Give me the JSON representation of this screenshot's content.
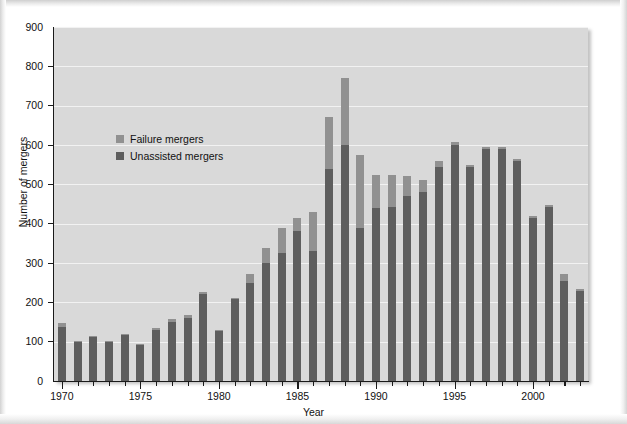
{
  "figure": {
    "background_color": "#ffffff",
    "plot_background_color": "#d9d9d9",
    "gridline_color": "#f2f2f2"
  },
  "legend": {
    "position": "inside-top-left",
    "items": [
      {
        "label": "Failure mergers",
        "color": "#919191",
        "swatch_name": "legend-swatch-failure"
      },
      {
        "label": "Unassisted mergers",
        "color": "#5e5e5e",
        "swatch_name": "legend-swatch-unassisted"
      }
    ]
  },
  "chart_data": {
    "type": "bar",
    "stacked": true,
    "title": "",
    "xlabel": "Year",
    "ylabel": "Number of mergers",
    "ylim": [
      0,
      900
    ],
    "ytick_step": 100,
    "yticks": [
      0,
      100,
      200,
      300,
      400,
      500,
      600,
      700,
      800,
      900
    ],
    "ytick_labels": [
      "0",
      "100",
      "200",
      "300",
      "400",
      "500",
      "600",
      "700",
      "800",
      "900"
    ],
    "xlim": [
      1969.5,
      2003.5
    ],
    "xtick_labels": [
      "1970",
      "1975",
      "1980",
      "1985",
      "1990",
      "1995",
      "2000"
    ],
    "xtick_values": [
      1970,
      1975,
      1980,
      1985,
      1990,
      1995,
      2000
    ],
    "grid": true,
    "grid_axis": "y",
    "categories": [
      1970,
      1971,
      1972,
      1973,
      1974,
      1975,
      1976,
      1977,
      1978,
      1979,
      1980,
      1981,
      1982,
      1983,
      1984,
      1985,
      1986,
      1987,
      1988,
      1989,
      1990,
      1991,
      1992,
      1993,
      1994,
      1995,
      1996,
      1997,
      1998,
      1999,
      2000,
      2001,
      2002,
      2003
    ],
    "series": [
      {
        "name": "Unassisted mergers",
        "color": "#5e5e5e",
        "values": [
          138,
          100,
          113,
          100,
          118,
          92,
          130,
          150,
          160,
          222,
          126,
          208,
          250,
          300,
          325,
          382,
          330,
          540,
          600,
          390,
          440,
          442,
          470,
          480,
          545,
          600,
          545,
          590,
          590,
          560,
          415,
          442,
          255,
          228
        ]
      },
      {
        "name": "Failure mergers",
        "color": "#919191",
        "values": [
          10,
          2,
          2,
          2,
          2,
          2,
          5,
          8,
          8,
          5,
          4,
          4,
          22,
          38,
          65,
          33,
          100,
          132,
          170,
          185,
          85,
          82,
          52,
          30,
          15,
          8,
          5,
          5,
          5,
          5,
          5,
          5,
          17,
          5
        ]
      },
      {
        "name": "Total",
        "color": "",
        "values": [
          148,
          102,
          115,
          102,
          120,
          94,
          135,
          158,
          168,
          227,
          130,
          212,
          272,
          338,
          390,
          415,
          430,
          672,
          770,
          575,
          525,
          524,
          522,
          510,
          560,
          608,
          550,
          595,
          595,
          565,
          420,
          447,
          272,
          233
        ]
      }
    ]
  }
}
